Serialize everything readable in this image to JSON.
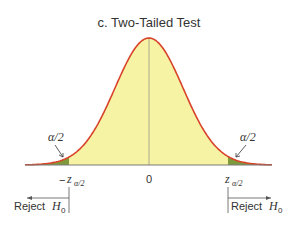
{
  "title": "c. Two-Tailed Test",
  "colors": {
    "curve": "#d9432a",
    "body_fill": "#f6f3a4",
    "tail_fill": "#7f9a3c",
    "axis": "#7a7a7a",
    "text": "#333333"
  },
  "tail_labels": {
    "left": "α/2",
    "right": "α/2"
  },
  "axis_ticks": {
    "left_prefix": "−",
    "z": "z",
    "sub": "α/2",
    "center": "0"
  },
  "reject": {
    "left_word": "Reject ",
    "right_word": "Reject ",
    "H": "H",
    "sub": "0"
  },
  "chart_data": {
    "type": "area",
    "title": "c. Two-Tailed Test",
    "x_ticks": [
      "−z_{α/2}",
      "0",
      "z_{α/2}"
    ],
    "shaded_regions": [
      {
        "from": "-inf",
        "to": "−z_{α/2}",
        "area": "α/2",
        "label": "Reject H0"
      },
      {
        "from": "z_{α/2}",
        "to": "+inf",
        "area": "α/2",
        "label": "Reject H0"
      }
    ],
    "annotations": [
      "α/2",
      "α/2",
      "Reject H0",
      "Reject H0"
    ],
    "grid": false
  }
}
